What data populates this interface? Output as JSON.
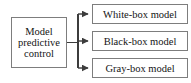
{
  "diagram": {
    "type": "flowchart",
    "orientation": "left-to-right",
    "source": {
      "id": "model-predictive-control",
      "label": "Model predictive control",
      "label_lines": [
        "Model",
        "predictive",
        "control"
      ]
    },
    "targets": [
      {
        "id": "white-box-model",
        "label": "White-box model"
      },
      {
        "id": "black-box-model",
        "label": "Black-box model"
      },
      {
        "id": "gray-box-model",
        "label": "Gray-box model"
      }
    ],
    "edges": [
      {
        "from": "model-predictive-control",
        "to": "white-box-model",
        "arrow": "single",
        "style": "solid"
      },
      {
        "from": "model-predictive-control",
        "to": "black-box-model",
        "arrow": "single",
        "style": "solid"
      },
      {
        "from": "model-predictive-control",
        "to": "gray-box-model",
        "arrow": "single",
        "style": "solid"
      }
    ],
    "colors": {
      "border": "#7d7d7d",
      "connector": "#3c3c3c",
      "text": "#141414",
      "background": "#ffffff"
    }
  }
}
